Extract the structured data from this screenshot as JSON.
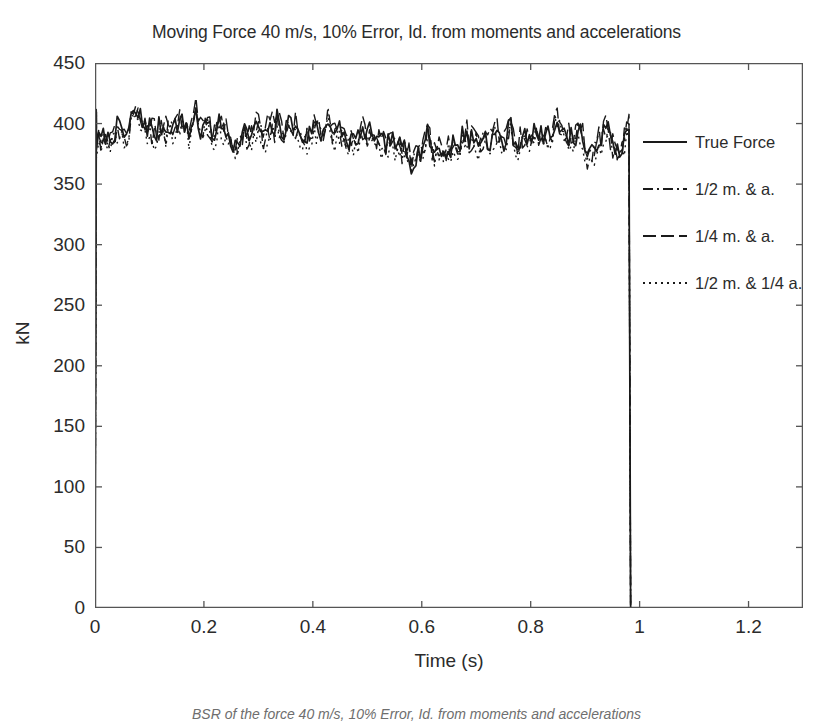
{
  "chart_data": {
    "type": "line",
    "title": "Moving Force 40 m/s, 10% Error, Id. from moments and accelerations",
    "xlabel": "Time (s)",
    "ylabel": "kN",
    "xlim": [
      0,
      1.3
    ],
    "ylim": [
      0,
      450
    ],
    "xticks": [
      0,
      0.2,
      0.4,
      0.6,
      0.8,
      1,
      1.2
    ],
    "xtick_labels": [
      "0",
      "0.2",
      "0.4",
      "0.6",
      "0.8",
      "1",
      "1.2"
    ],
    "yticks": [
      0,
      50,
      100,
      150,
      200,
      250,
      300,
      350,
      400,
      450
    ],
    "ytick_labels": [
      "0",
      "50",
      "100",
      "150",
      "200",
      "250",
      "300",
      "350",
      "400",
      "450"
    ],
    "grid": false,
    "legend_position": "right-inside",
    "box": true,
    "tick_direction": "in",
    "line_color": "#1a1a1a",
    "background": "#ffffff",
    "series": [
      {
        "name": "True Force",
        "style": "solid",
        "color": "#1a1a1a",
        "x": [
          0,
          0.002,
          0.98,
          0.982,
          1.3
        ],
        "values": [
          0,
          390,
          390,
          0,
          0
        ],
        "description": "Step force: rises from 0 to ~390 kN at t=0, held with ~10% random noise until t=0.98 s, then drops to 0 kN."
      },
      {
        "name": "1/2 m. & a.",
        "style": "dashdot",
        "color": "#1a1a1a",
        "x": [
          0,
          0.002,
          0.98,
          0.982,
          1.3
        ],
        "values": [
          0,
          388,
          388,
          0,
          0
        ],
        "description": "Identified force using half the moments and accelerations; noisy reconstruction around 385 kN."
      },
      {
        "name": "1/4 m. & a.",
        "style": "dashed",
        "color": "#1a1a1a",
        "x": [
          0,
          0.002,
          0.98,
          0.982,
          1.3
        ],
        "values": [
          0,
          392,
          392,
          0,
          0
        ],
        "description": "Identified force using a quarter of the moments and accelerations."
      },
      {
        "name": "1/2 m. & 1/4 a.",
        "style": "dotted",
        "color": "#1a1a1a",
        "x": [
          0,
          0.002,
          0.98,
          0.982,
          1.3
        ],
        "values": [
          0,
          385,
          385,
          0,
          0
        ],
        "description": "Identified force using half the moments and a quarter of the accelerations."
      }
    ],
    "noise": {
      "mean_level": 390,
      "min": 352,
      "max": 422,
      "band_description": "All four traces oscillate together between roughly 350 and 422 kN over 0 < t < 0.98 s"
    }
  },
  "legend": {
    "entries": [
      {
        "label": "True Force",
        "style": "solid"
      },
      {
        "label": "1/2 m. & a.",
        "style": "dashdot"
      },
      {
        "label": "1/4 m. & a.",
        "style": "dashed"
      },
      {
        "label": "1/2 m. & 1/4 a.",
        "style": "dotted"
      }
    ]
  },
  "caption": {
    "text": "BSR of the force 40 m/s, 10% Error, Id. from moments and accelerations"
  }
}
